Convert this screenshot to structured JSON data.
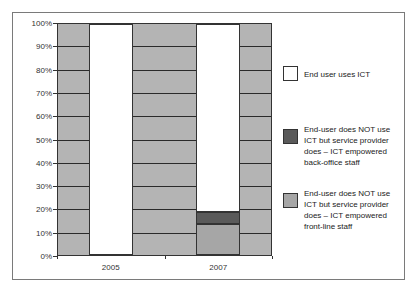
{
  "chart_data": {
    "type": "bar",
    "stacked": true,
    "percent_stacked": true,
    "title": "",
    "xlabel": "",
    "ylabel": "",
    "categories": [
      "2005",
      "2007"
    ],
    "series": [
      {
        "name": "End-user does NOT use ICT but service provider does – ICT empowered front-line staff",
        "color": "#a6a6a6",
        "values": [
          0,
          13.5
        ]
      },
      {
        "name": "End-user does NOT use ICT but service provider does – ICT empowered back-office staff",
        "color": "#5a5a5a",
        "values": [
          0,
          5
        ]
      },
      {
        "name": "End user uses ICT",
        "color": "#ffffff",
        "values": [
          100,
          81.5
        ]
      }
    ],
    "ylim": [
      0,
      100
    ],
    "yticks": [
      "0%",
      "10%",
      "20%",
      "30%",
      "40%",
      "50%",
      "60%",
      "70%",
      "80%",
      "90%",
      "100%"
    ],
    "grid": true,
    "plot_background": "#b4b4b4",
    "legend_position": "right"
  },
  "legend": [
    {
      "label": "End user uses ICT",
      "color": "#ffffff"
    },
    {
      "label": "End-user does NOT use ICT but service provider does – ICT empowered back-office staff",
      "color": "#5a5a5a"
    },
    {
      "label": "End-user does NOT use ICT but service provider does – ICT empowered front-line staff",
      "color": "#a6a6a6"
    }
  ]
}
